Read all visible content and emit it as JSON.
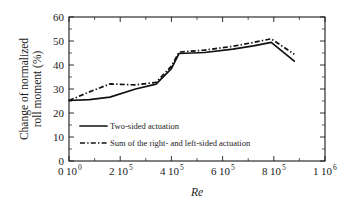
{
  "chart_data": {
    "type": "line",
    "title": "",
    "xlabel": "Re",
    "ylabel": "Change of normalized roll moment (%)",
    "ylabel_line1": "Change of normalized",
    "ylabel_line2": "roll moment (%)",
    "xlim": [
      0,
      1000000
    ],
    "ylim": [
      0,
      60
    ],
    "grid": false,
    "legend_position": "lower-left-inside",
    "x_ticks": [
      {
        "value": 0,
        "mantissa": "0",
        "base": "10",
        "exponent": "0"
      },
      {
        "value": 200000,
        "mantissa": "2",
        "base": "10",
        "exponent": "5"
      },
      {
        "value": 400000,
        "mantissa": "4",
        "base": "10",
        "exponent": "5"
      },
      {
        "value": 600000,
        "mantissa": "6",
        "base": "10",
        "exponent": "5"
      },
      {
        "value": 800000,
        "mantissa": "8",
        "base": "10",
        "exponent": "5"
      },
      {
        "value": 1000000,
        "mantissa": "1",
        "base": "10",
        "exponent": "6"
      }
    ],
    "y_ticks": [
      0,
      10,
      20,
      30,
      40,
      50,
      60
    ],
    "y_tick_labels": [
      "0",
      "10",
      "20",
      "30",
      "40",
      "50",
      "60"
    ],
    "series": [
      {
        "name": "Two-sided actuation",
        "style": "solid",
        "color": "#111111",
        "x": [
          0,
          80000,
          160000,
          260000,
          340000,
          400000,
          430000,
          530000,
          640000,
          720000,
          790000,
          880000
        ],
        "values": [
          25.2,
          25.6,
          26.6,
          30.0,
          32.0,
          38.5,
          44.8,
          45.2,
          46.6,
          48.0,
          49.4,
          41.6
        ]
      },
      {
        "name": "Sum of the right- and left-sided actuation",
        "style": "dash-dot",
        "color": "#111111",
        "x": [
          0,
          80000,
          160000,
          260000,
          340000,
          400000,
          430000,
          530000,
          640000,
          720000,
          790000,
          880000
        ],
        "values": [
          25.2,
          28.8,
          32.1,
          31.7,
          32.8,
          39.5,
          45.4,
          46.2,
          47.8,
          49.4,
          50.9,
          44.5
        ]
      }
    ]
  },
  "legend": {
    "entries": [
      {
        "label": "Two-sided actuation",
        "style": "solid"
      },
      {
        "label": "Sum of the right- and left-sided actuation",
        "style": "dash-dot"
      }
    ]
  }
}
